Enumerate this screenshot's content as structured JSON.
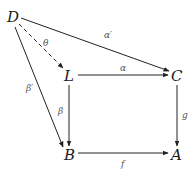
{
  "nodes": {
    "D": {
      "label": "D",
      "x": 14,
      "y": 22
    },
    "L": {
      "label": "L",
      "x": 69,
      "y": 80
    },
    "C": {
      "label": "C",
      "x": 176,
      "y": 80
    },
    "B": {
      "label": "B",
      "x": 69,
      "y": 159
    },
    "A": {
      "label": "A",
      "x": 176,
      "y": 159
    }
  },
  "edges": {
    "theta": {
      "from": "D",
      "to": "L",
      "label": "θ",
      "style": "dashed"
    },
    "alpha_prime": {
      "from": "D",
      "to": "C",
      "label": "α′",
      "style": "solid"
    },
    "beta_prime": {
      "from": "D",
      "to": "B",
      "label": "β′",
      "style": "solid"
    },
    "alpha": {
      "from": "L",
      "to": "C",
      "label": "α",
      "style": "solid"
    },
    "beta": {
      "from": "L",
      "to": "B",
      "label": "β",
      "style": "solid"
    },
    "g": {
      "from": "C",
      "to": "A",
      "label": "g",
      "style": "solid"
    },
    "f": {
      "from": "B",
      "to": "A",
      "label": "f",
      "style": "solid"
    }
  },
  "colors": {
    "line": "#222222",
    "node_text": "#1a1a1a",
    "label_text": "#555555"
  }
}
